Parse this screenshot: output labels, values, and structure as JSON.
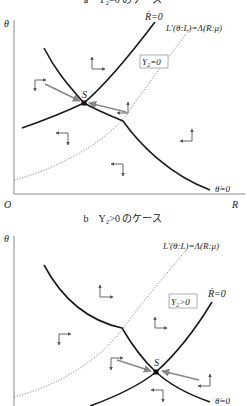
{
  "panel_a": {
    "title": "a　Y₂=0 のケース",
    "y_axis_label": "θ",
    "x_axis_label": "R",
    "origin_label": "O",
    "r_dot_label": "Ṙ=0",
    "theta_dot_label": "θ̇=0",
    "l_curve_label": "L′(θ:L)=Λ(R:μ)",
    "region_label": "Y₂=0",
    "saddle_label": "S"
  },
  "panel_b": {
    "title": "b　Y₂>0 のケース",
    "y_axis_label": "θ",
    "x_axis_label": "R",
    "origin_label": "O",
    "r_dot_label": "Ṙ=0",
    "theta_dot_label": "θ̇=0",
    "l_curve_label": "L′(θ:L)=Λ(R:μ)",
    "region_label": "Y₂>0",
    "saddle_label": "S"
  }
}
